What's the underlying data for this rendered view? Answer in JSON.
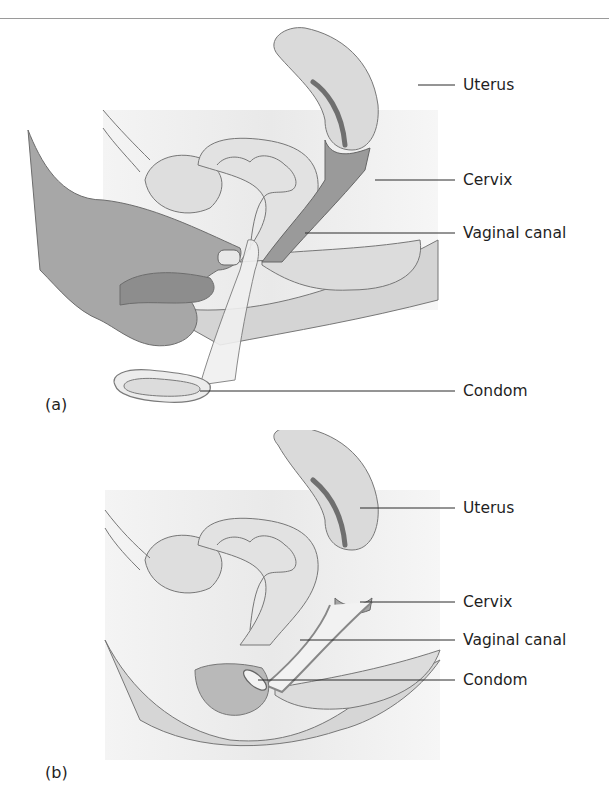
{
  "figure": {
    "panels": [
      {
        "tag": "(a)",
        "labels": {
          "uterus": "Uterus",
          "cervix": "Cervix",
          "vaginal_canal": "Vaginal canal",
          "condom": "Condom"
        }
      },
      {
        "tag": "(b)",
        "labels": {
          "uterus": "Uterus",
          "cervix": "Cervix",
          "vaginal_canal": "Vaginal canal",
          "condom": "Condom"
        }
      }
    ],
    "colors": {
      "background_tint": "#ececec",
      "tissue_fill": "#d9d9d9",
      "tissue_dark": "#9c9c9c",
      "hand_fill": "#a8a8a8",
      "outline": "#6e6e6e",
      "leader_line": "#2a2a2a"
    }
  }
}
